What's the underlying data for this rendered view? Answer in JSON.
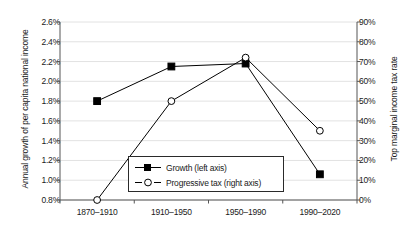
{
  "chart_data": {
    "type": "line",
    "title": "",
    "xlabel": "",
    "categories": [
      "1870–1910",
      "1910–1950",
      "1950–1990",
      "1990–2020"
    ],
    "grid": true,
    "legend_position": "inside-bottom-center",
    "axes": {
      "left": {
        "label": "Annual growth of per capita national income",
        "ticks": [
          "0.8%",
          "1.0%",
          "1.2%",
          "1.4%",
          "1.6%",
          "1.8%",
          "2.0%",
          "2.2%",
          "2.4%",
          "2.6%"
        ],
        "tick_values": [
          0.8,
          1.0,
          1.2,
          1.4,
          1.6,
          1.8,
          2.0,
          2.2,
          2.4,
          2.6
        ],
        "ylim": [
          0.8,
          2.6
        ]
      },
      "right": {
        "label": "Top marginal income tax rate",
        "ticks": [
          "0%",
          "10%",
          "20%",
          "30%",
          "40%",
          "50%",
          "60%",
          "70%",
          "80%",
          "90%"
        ],
        "tick_values": [
          0,
          10,
          20,
          30,
          40,
          50,
          60,
          70,
          80,
          90
        ],
        "ylim": [
          0,
          90
        ]
      }
    },
    "series": [
      {
        "name": "Growth (left axis)",
        "legend_label": "Growth (left axis)",
        "axis": "left",
        "marker": "filled-square",
        "line_style": "solid",
        "color": "#000000",
        "values": [
          1.8,
          2.15,
          2.18,
          1.06
        ]
      },
      {
        "name": "Progressive tax (right axis)",
        "legend_label": "Progressive tax (right axis)",
        "axis": "right",
        "marker": "open-circle",
        "line_style": "solid",
        "color": "#000000",
        "values": [
          0,
          50,
          72,
          35
        ]
      }
    ]
  }
}
